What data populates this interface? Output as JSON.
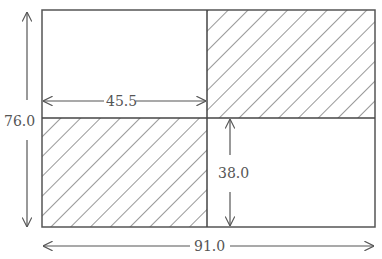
{
  "diagram": {
    "type": "dimensioned-rectangle",
    "colors": {
      "stroke": "#555555",
      "hatch": "#333333",
      "background": "#ffffff",
      "text": "#555555"
    },
    "regions": [
      {
        "name": "top-left",
        "hatched": false
      },
      {
        "name": "top-right",
        "hatched": true
      },
      {
        "name": "bottom-left",
        "hatched": true
      },
      {
        "name": "bottom-right",
        "hatched": false
      }
    ],
    "dimensions": {
      "total_height": "76.0",
      "half_width": "45.5",
      "half_height": "38.0",
      "total_width": "91.0"
    }
  }
}
